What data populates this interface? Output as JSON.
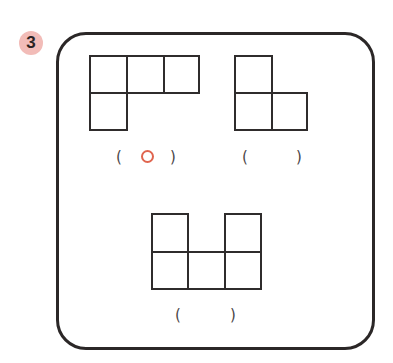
{
  "problem": {
    "number": "3",
    "badge_color": "#f2bcb8",
    "accent_color": "#e0654f"
  },
  "shapes": [
    {
      "id": "shape-1",
      "description": "3 squares in top row, 1 square below left",
      "cells": [
        [
          0,
          0
        ],
        [
          1,
          0
        ],
        [
          2,
          0
        ],
        [
          0,
          1
        ]
      ],
      "answer": {
        "open": "(",
        "close": ")",
        "mark": "circle"
      }
    },
    {
      "id": "shape-2",
      "description": "1 square on top left, 2 squares in bottom row",
      "cells": [
        [
          0,
          0
        ],
        [
          0,
          1
        ],
        [
          1,
          1
        ]
      ],
      "answer": {
        "open": "(",
        "close": ")",
        "mark": ""
      }
    },
    {
      "id": "shape-3",
      "description": "3 squares in bottom row, squares above left and right",
      "cells": [
        [
          0,
          0
        ],
        [
          2,
          0
        ],
        [
          0,
          1
        ],
        [
          1,
          1
        ],
        [
          2,
          1
        ]
      ],
      "answer": {
        "open": "(",
        "close": ")",
        "mark": ""
      }
    }
  ]
}
